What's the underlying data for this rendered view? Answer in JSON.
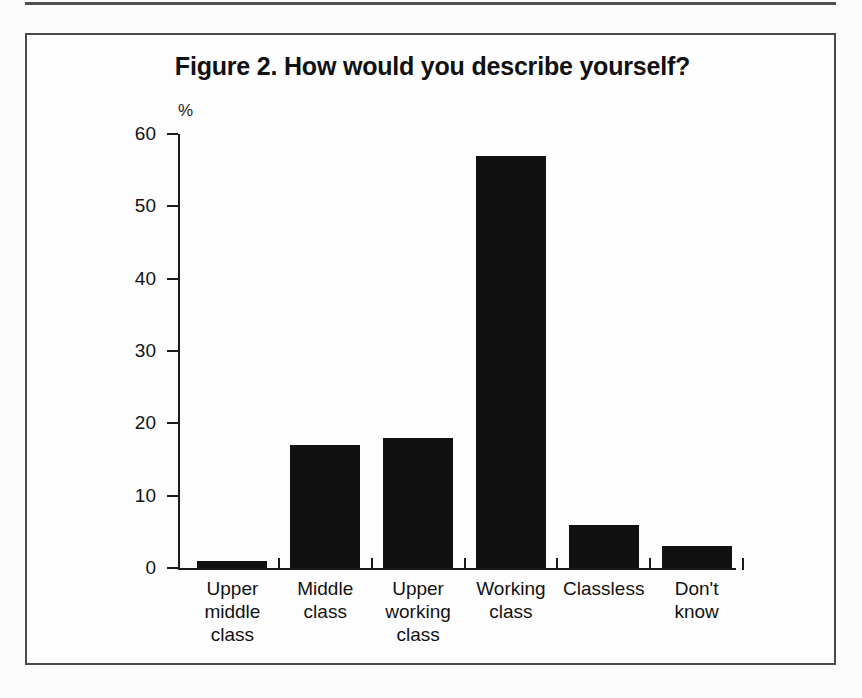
{
  "figure": {
    "title": "Figure 2. How would you describe yourself?",
    "unit_label": "%"
  },
  "chart_data": {
    "type": "bar",
    "title": "Figure 2. How would you describe yourself?",
    "xlabel": "",
    "ylabel": "%",
    "ylim": [
      0,
      60
    ],
    "yticks": [
      0,
      10,
      20,
      30,
      40,
      50,
      60
    ],
    "ytick_labels": [
      "0",
      "10",
      "20",
      "30",
      "40",
      "50",
      "60"
    ],
    "grid": false,
    "legend": null,
    "bar_color": "#111111",
    "categories": [
      "Upper middle class",
      "Middle class",
      "Upper working class",
      "Working class",
      "Classless",
      "Don't know"
    ],
    "category_lines": [
      [
        "Upper",
        "middle",
        "class"
      ],
      [
        "Middle",
        "class"
      ],
      [
        "Upper",
        "working",
        "class"
      ],
      [
        "Working",
        "class"
      ],
      [
        "Classless"
      ],
      [
        "Don't know"
      ]
    ],
    "values": [
      1,
      17,
      18,
      57,
      6,
      3
    ]
  }
}
